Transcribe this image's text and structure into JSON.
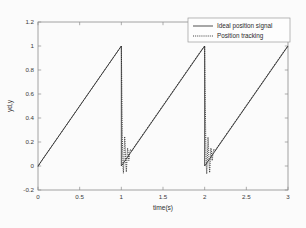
{
  "figure": {
    "background": "#fbfbfb",
    "axes_color": "#8d8d8d"
  },
  "chart_data": {
    "type": "line",
    "title": "",
    "xlabel": "time(s)",
    "ylabel": "yd,y",
    "xlim": [
      0,
      3
    ],
    "ylim": [
      -0.2,
      1.2
    ],
    "xticks": [
      0,
      0.5,
      1,
      1.5,
      2,
      2.5,
      3
    ],
    "xticklabels": [
      "0",
      "0.5",
      "1",
      "1.5",
      "2",
      "2.5",
      "3"
    ],
    "yticks": [
      -0.2,
      0,
      0.2,
      0.4,
      0.6,
      0.8,
      1,
      1.2
    ],
    "yticklabels": [
      "-0.2",
      "0",
      "0.2",
      "0.4",
      "0.6",
      "0.8",
      "1",
      "1.2"
    ],
    "grid": false,
    "legend_position": "upper right",
    "legend_entries": [
      "Ideal position signal",
      "Position tracking"
    ],
    "series": [
      {
        "name": "Ideal position signal",
        "style": "solid",
        "color": "#303030",
        "description": "Sawtooth reference: ramps linearly from 0 to 1 over each 1 s period, then drops instantly to 0 at t=1 and t=2.",
        "points": [
          [
            0.0,
            0.0
          ],
          [
            1.0,
            1.0
          ],
          [
            1.0,
            0.0
          ],
          [
            2.0,
            1.0
          ],
          [
            2.0,
            0.0
          ],
          [
            3.0,
            1.0
          ]
        ]
      },
      {
        "name": "Position tracking",
        "style": "dotted",
        "color": "#222222",
        "description": "Controller output tracks the ramp closely, then overshoots/oscillates briefly after each sawtooth discontinuity before re-converging.",
        "points": [
          [
            0.0,
            -0.005
          ],
          [
            0.05,
            0.05
          ],
          [
            0.1,
            0.1
          ],
          [
            0.15,
            0.15
          ],
          [
            0.2,
            0.2
          ],
          [
            0.3,
            0.3
          ],
          [
            0.4,
            0.4
          ],
          [
            0.5,
            0.5
          ],
          [
            0.6,
            0.6
          ],
          [
            0.7,
            0.7
          ],
          [
            0.8,
            0.8
          ],
          [
            0.9,
            0.9
          ],
          [
            0.96,
            0.96
          ],
          [
            1.0,
            1.0
          ],
          [
            1.005,
            0.7
          ],
          [
            1.01,
            0.38
          ],
          [
            1.015,
            0.12
          ],
          [
            1.02,
            -0.01
          ],
          [
            1.025,
            -0.06
          ],
          [
            1.03,
            0.02
          ],
          [
            1.035,
            0.15
          ],
          [
            1.04,
            0.245
          ],
          [
            1.045,
            0.2
          ],
          [
            1.05,
            0.09
          ],
          [
            1.055,
            0.0
          ],
          [
            1.06,
            -0.05
          ],
          [
            1.065,
            0.01
          ],
          [
            1.07,
            0.095
          ],
          [
            1.075,
            0.15
          ],
          [
            1.08,
            0.125
          ],
          [
            1.085,
            0.075
          ],
          [
            1.09,
            0.045
          ],
          [
            1.095,
            0.07
          ],
          [
            1.1,
            0.11
          ],
          [
            1.11,
            0.14
          ],
          [
            1.12,
            0.125
          ],
          [
            1.13,
            0.13
          ],
          [
            1.15,
            0.155
          ],
          [
            1.2,
            0.205
          ],
          [
            1.25,
            0.255
          ],
          [
            1.3,
            0.305
          ],
          [
            1.4,
            0.405
          ],
          [
            1.5,
            0.505
          ],
          [
            1.6,
            0.605
          ],
          [
            1.7,
            0.705
          ],
          [
            1.8,
            0.805
          ],
          [
            1.9,
            0.905
          ],
          [
            1.96,
            0.965
          ],
          [
            2.0,
            1.0
          ],
          [
            2.005,
            0.7
          ],
          [
            2.01,
            0.38
          ],
          [
            2.015,
            0.12
          ],
          [
            2.02,
            -0.01
          ],
          [
            2.025,
            -0.065
          ],
          [
            2.03,
            0.02
          ],
          [
            2.035,
            0.15
          ],
          [
            2.04,
            0.24
          ],
          [
            2.045,
            0.195
          ],
          [
            2.05,
            0.085
          ],
          [
            2.055,
            -0.005
          ],
          [
            2.06,
            -0.055
          ],
          [
            2.065,
            0.01
          ],
          [
            2.07,
            0.095
          ],
          [
            2.075,
            0.15
          ],
          [
            2.08,
            0.125
          ],
          [
            2.085,
            0.075
          ],
          [
            2.09,
            0.045
          ],
          [
            2.095,
            0.07
          ],
          [
            2.1,
            0.11
          ],
          [
            2.11,
            0.14
          ],
          [
            2.12,
            0.125
          ],
          [
            2.13,
            0.13
          ],
          [
            2.15,
            0.155
          ],
          [
            2.2,
            0.205
          ],
          [
            2.25,
            0.255
          ],
          [
            2.3,
            0.305
          ],
          [
            2.4,
            0.405
          ],
          [
            2.5,
            0.505
          ],
          [
            2.6,
            0.605
          ],
          [
            2.7,
            0.705
          ],
          [
            2.8,
            0.805
          ],
          [
            2.9,
            0.905
          ],
          [
            2.96,
            0.965
          ],
          [
            3.0,
            1.0
          ]
        ]
      }
    ]
  }
}
